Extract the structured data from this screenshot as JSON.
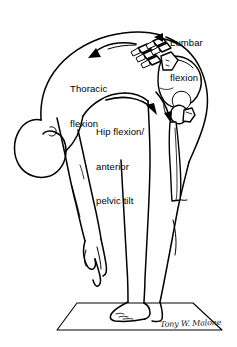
{
  "figure": {
    "background_color": "#ffffff",
    "line_color": "#000000",
    "width": 237,
    "height": 347
  },
  "annotations": {
    "lumbar": {
      "label": "Lumbar\nflexion",
      "line1": "Lumbar",
      "line2": "flexion",
      "arrow": "down-left-arrow-to-lumbar-spine"
    },
    "thoracic": {
      "label": "Thoracic\nflexion",
      "line1": "Thoracic",
      "line2": "flexion",
      "arrow": "curved-left-arrow-along-thoracic-spine"
    },
    "hip": {
      "label": "Hip flexion/\nanterior\npelvic tilt",
      "line1": "Hip flexion/",
      "line2": "anterior",
      "line3": "pelvic tilt",
      "arrow": "curved-right-arrow-to-femoral-head"
    }
  },
  "signature": {
    "text": "Tony W. Malone"
  },
  "anatomy": {
    "parts": [
      "head",
      "neck",
      "torso-back",
      "hanging-arm",
      "hand",
      "lumbar-vertebrae",
      "pelvis-ilium",
      "sacrum",
      "femoral-head",
      "femur",
      "leg",
      "foot",
      "exercise-mat"
    ]
  }
}
